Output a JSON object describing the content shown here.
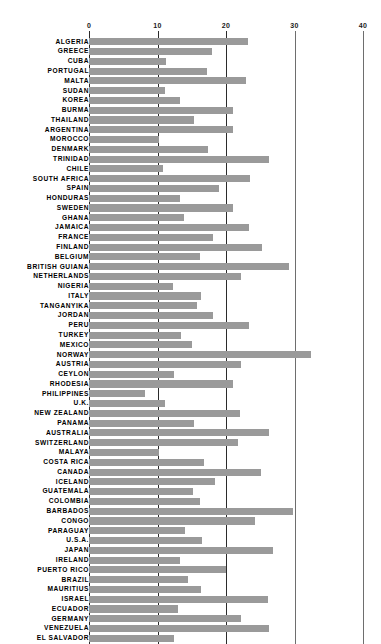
{
  "chart": {
    "type": "bar-horizontal",
    "title": "",
    "xlabel": "",
    "ylabel": "",
    "axis_ticks": [
      "0",
      "10",
      "20",
      "30",
      "40"
    ],
    "bar_color": "#9a9a9a",
    "gridline_major_color": "#2b2b2b",
    "gridline_minor_color": "#6e6e6e",
    "background_color": "#ffffff"
  },
  "chart_data": {
    "type": "bar",
    "orientation": "horizontal",
    "title": "",
    "xlabel": "",
    "ylabel": "",
    "xlim": [
      0,
      40
    ],
    "ticks": [
      0,
      10,
      20,
      30,
      40
    ],
    "grid": true,
    "legend": "none",
    "categories": [
      "ALGERIA",
      "GREECE",
      "CUBA",
      "PORTUGAL",
      "MALTA",
      "SUDAN",
      "KOREA",
      "BURMA",
      "THAILAND",
      "ARGENTINA",
      "MOROCCO",
      "DENMARK",
      "TRINIDAD",
      "CHILE",
      "SOUTH AFRICA",
      "SPAIN",
      "HONDURAS",
      "SWEDEN",
      "GHANA",
      "JAMAICA",
      "FRANCE",
      "FINLAND",
      "BELGIUM",
      "BRITISH GUIANA",
      "NETHERLANDS",
      "NIGERIA",
      "ITALY",
      "TANGANYIKA",
      "JORDAN",
      "PERU",
      "TURKEY",
      "MEXICO",
      "NORWAY",
      "AUSTRIA",
      "CEYLON",
      "RHODESIA",
      "PHILIPPINES",
      "U.K.",
      "NEW ZEALAND",
      "PANAMA",
      "AUSTRALIA",
      "SWITZERLAND",
      "MALAYA",
      "COSTA RICA",
      "CANADA",
      "ICELAND",
      "GUATEMALA",
      "COLOMBIA",
      "BARBADOS",
      "CONGO",
      "PARAGUAY",
      "U.S.A.",
      "JAPAN",
      "IRELAND",
      "PUERTO RICO",
      "BRAZIL",
      "MAURITIUS",
      "ISRAEL",
      "ECUADOR",
      "GERMANY",
      "VENEZUELA",
      "EL SALVADOR"
    ],
    "values": [
      23.2,
      18.0,
      11.2,
      17.2,
      22.9,
      11.1,
      13.3,
      21.0,
      15.3,
      21.0,
      10.2,
      17.4,
      26.3,
      10.8,
      23.5,
      19.0,
      13.3,
      21.0,
      13.9,
      23.4,
      18.1,
      25.3,
      16.2,
      29.2,
      22.2,
      12.3,
      16.3,
      15.8,
      18.1,
      23.4,
      13.5,
      15.0,
      32.4,
      22.2,
      12.4,
      21.0,
      8.2,
      11.1,
      22.0,
      15.3,
      26.3,
      21.8,
      10.2,
      16.8,
      25.1,
      18.4,
      15.2,
      16.2,
      29.8,
      24.2,
      14.0,
      16.5,
      26.9,
      13.3,
      20.0,
      14.5,
      16.3,
      26.2,
      13.0,
      22.2,
      26.3,
      12.4
    ]
  }
}
